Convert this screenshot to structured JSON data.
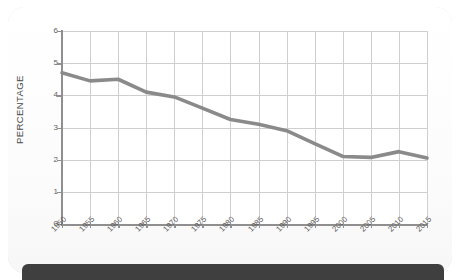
{
  "card": {
    "shape": "rounded-rectangle-border"
  },
  "footer": {
    "label": ""
  },
  "chart_data": {
    "type": "line",
    "title": "",
    "subtitle": "",
    "xlabel": "",
    "ylabel": "PERCENTAGE",
    "categories": [
      "1950",
      "1955",
      "1960",
      "1965",
      "1970",
      "1975",
      "1980",
      "1985",
      "1990",
      "1995",
      "2000",
      "2005",
      "2010",
      "2015"
    ],
    "x": [
      1950,
      1955,
      1960,
      1965,
      1970,
      1975,
      1980,
      1985,
      1990,
      1995,
      2000,
      2005,
      2010,
      2015
    ],
    "values": [
      4.7,
      4.45,
      4.5,
      4.1,
      3.95,
      3.6,
      3.25,
      3.1,
      2.9,
      2.5,
      2.1,
      2.07,
      2.25,
      2.05
    ],
    "series": [
      {
        "name": "Percentage",
        "color": "#8a8a8a",
        "values": [
          4.7,
          4.45,
          4.5,
          4.1,
          3.95,
          3.6,
          3.25,
          3.1,
          2.9,
          2.5,
          2.1,
          2.07,
          2.25,
          2.05
        ]
      }
    ],
    "ylim": [
      0,
      6
    ],
    "yticks": [
      0,
      1,
      2,
      3,
      4,
      5,
      6
    ],
    "ytick_labels": [
      "0",
      "1",
      "2",
      "3",
      "4",
      "5",
      "6"
    ],
    "xlim": [
      1950,
      2015
    ],
    "grid": true,
    "grid_color": "#cfcfcf",
    "legend": false,
    "legend_position": "none",
    "line_width": 3.6,
    "axis_color": "#8f8f8f",
    "background": "#ffffff"
  },
  "colors": {
    "line": "#8a8a8a",
    "grid": "#cfcfcf",
    "axis": "#8f8f8f",
    "text": "#5d5d5d",
    "card_border": "#c9c9c9",
    "footer_bar": "#3f3f3f",
    "page_background": "#ffffff"
  }
}
